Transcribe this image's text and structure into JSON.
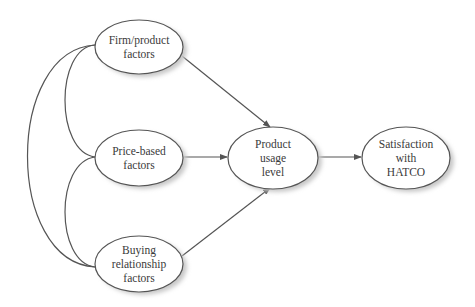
{
  "diagram": {
    "type": "path-diagram",
    "colors": {
      "stroke": "#555555",
      "shadow": "#c8c8c8",
      "text": "#3a3a3a",
      "fill": "#ffffff"
    },
    "nodes": [
      {
        "id": "firm",
        "lines": [
          "Firm/product",
          "factors"
        ],
        "cx": 139,
        "cy": 47,
        "rx": 44,
        "ry": 27
      },
      {
        "id": "price",
        "lines": [
          "Price-based",
          "factors"
        ],
        "cx": 139,
        "cy": 158,
        "rx": 44,
        "ry": 28
      },
      {
        "id": "buying",
        "lines": [
          "Buying",
          "relationship",
          "factors"
        ],
        "cx": 139,
        "cy": 264,
        "rx": 44,
        "ry": 28
      },
      {
        "id": "product",
        "lines": [
          "Product",
          "usage",
          "level"
        ],
        "cx": 273,
        "cy": 158,
        "rx": 45,
        "ry": 31
      },
      {
        "id": "satisfaction",
        "lines": [
          "Satisfaction",
          "with",
          "HATCO"
        ],
        "cx": 406,
        "cy": 158,
        "rx": 44,
        "ry": 31
      }
    ],
    "edges": [
      {
        "from": "firm",
        "to": "product",
        "type": "arrow"
      },
      {
        "from": "price",
        "to": "product",
        "type": "arrow"
      },
      {
        "from": "buying",
        "to": "product",
        "type": "arrow"
      },
      {
        "from": "product",
        "to": "satisfaction",
        "type": "arrow"
      },
      {
        "from": "firm",
        "to": "price",
        "type": "correlation"
      },
      {
        "from": "price",
        "to": "buying",
        "type": "correlation"
      },
      {
        "from": "firm",
        "to": "buying",
        "type": "correlation"
      }
    ]
  }
}
